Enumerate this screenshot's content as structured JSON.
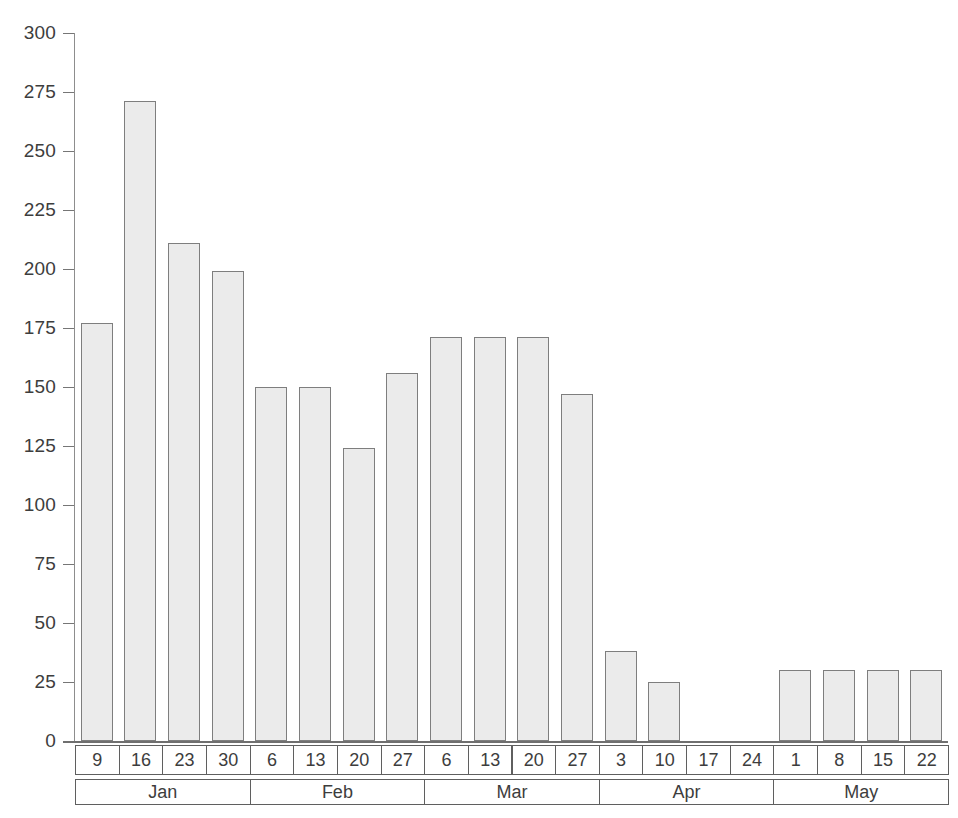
{
  "chart_data": {
    "type": "bar",
    "title": "",
    "xlabel": "",
    "ylabel": "",
    "ylim": [
      0,
      300
    ],
    "ytick_step": 25,
    "grid": false,
    "legend": null,
    "yticks": [
      "300",
      "275",
      "250",
      "225",
      "200",
      "175",
      "150",
      "125",
      "100",
      "75",
      "50",
      "25",
      "0"
    ],
    "ytick_values": [
      300,
      275,
      250,
      225,
      200,
      175,
      150,
      125,
      100,
      75,
      50,
      25,
      0
    ],
    "categories": [
      "9",
      "16",
      "23",
      "30",
      "6",
      "13",
      "20",
      "27",
      "6",
      "13",
      "20",
      "27",
      "3",
      "10",
      "17",
      "24",
      "1",
      "8",
      "15",
      "22"
    ],
    "values": [
      177,
      271,
      211,
      199,
      150,
      150,
      124,
      156,
      171,
      171,
      171,
      147,
      38,
      25,
      0,
      0,
      30,
      30,
      30,
      30
    ],
    "groups": [
      {
        "label": "Jan",
        "span": 4
      },
      {
        "label": "Feb",
        "span": 4
      },
      {
        "label": "Mar",
        "span": 4
      },
      {
        "label": "Apr",
        "span": 4
      },
      {
        "label": "May",
        "span": 4
      }
    ],
    "bar_fill": "#ebebeb",
    "bar_border": "#7e7e7e",
    "axis_color": "#6f6f6f"
  }
}
